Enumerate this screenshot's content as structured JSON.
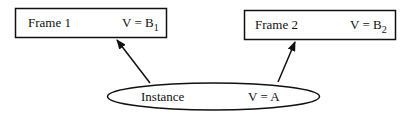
{
  "diagram": {
    "frames": [
      {
        "id": "frame1",
        "label": "Frame 1",
        "value_prefix": "V = B",
        "value_subscript": "1"
      },
      {
        "id": "frame2",
        "label": "Frame 2",
        "value_prefix": "V = B",
        "value_subscript": "2"
      }
    ],
    "instance": {
      "label": "Instance",
      "value": "V = A"
    },
    "edges": [
      {
        "from": "instance",
        "to": "frame1",
        "type": "arrow"
      },
      {
        "from": "instance",
        "to": "frame2",
        "type": "arrow"
      }
    ],
    "colors": {
      "stroke": "#111111",
      "background": "#ffffff"
    }
  }
}
